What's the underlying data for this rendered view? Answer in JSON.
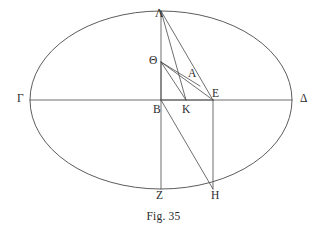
{
  "figure": {
    "caption": "Fig. 35",
    "caption_x": 163,
    "caption_y": 210
  },
  "style": {
    "stroke_color": "#4a4a4a",
    "stroke_width": 0.8,
    "ellipse_stroke_width": 0.9,
    "background": "#ffffff",
    "text_color": "#2b2b2b"
  },
  "ellipse": {
    "name": "outer-ellipse",
    "cx": 161,
    "cy": 100,
    "rx": 131,
    "ry": 89
  },
  "points": [
    {
      "id": "Lambda",
      "label": "Λ",
      "x": 161,
      "y": 11,
      "label_x": 155,
      "label_y": 8
    },
    {
      "id": "Theta",
      "label": "Θ",
      "x": 161,
      "y": 62,
      "label_x": 149,
      "label_y": 55
    },
    {
      "id": "A",
      "label": "A",
      "x": 193,
      "y": 80,
      "label_x": 188,
      "label_y": 68
    },
    {
      "id": "Gamma",
      "label": "Γ",
      "x": 30,
      "y": 100,
      "label_x": 17,
      "label_y": 93
    },
    {
      "id": "Delta",
      "label": "Δ",
      "x": 292,
      "y": 100,
      "label_x": 300,
      "label_y": 93
    },
    {
      "id": "E",
      "label": "E",
      "x": 213,
      "y": 100,
      "label_x": 212,
      "label_y": 88
    },
    {
      "id": "B",
      "label": "B",
      "x": 161,
      "y": 100,
      "label_x": 153,
      "label_y": 104
    },
    {
      "id": "K",
      "label": "K",
      "x": 186,
      "y": 100,
      "label_x": 182,
      "label_y": 104
    },
    {
      "id": "Z",
      "label": "Z",
      "x": 161,
      "y": 189,
      "label_x": 156,
      "label_y": 190
    },
    {
      "id": "H",
      "label": "H",
      "x": 213,
      "y": 189,
      "label_x": 211,
      "label_y": 190
    }
  ],
  "segments": [
    {
      "id": "gamma-delta-axis",
      "name": "horizontal-axis-gamma-delta",
      "x1": 30,
      "y1": 100,
      "x2": 292,
      "y2": 100
    },
    {
      "id": "lambda-z-axis",
      "name": "vertical-axis-lambda-z",
      "x1": 161,
      "y1": 11,
      "x2": 161,
      "y2": 189
    },
    {
      "id": "lambda-e",
      "name": "chord-lambda-e",
      "x1": 161,
      "y1": 11,
      "x2": 213,
      "y2": 100
    },
    {
      "id": "lambda-k",
      "name": "chord-lambda-k",
      "x1": 161,
      "y1": 11,
      "x2": 186,
      "y2": 100
    },
    {
      "id": "theta-e",
      "name": "chord-theta-e",
      "x1": 161,
      "y1": 62,
      "x2": 213,
      "y2": 100
    },
    {
      "id": "theta-k",
      "name": "chord-theta-k",
      "x1": 161,
      "y1": 62,
      "x2": 186,
      "y2": 100
    },
    {
      "id": "theta-b",
      "name": "chord-theta-b",
      "x1": 161,
      "y1": 62,
      "x2": 161,
      "y2": 100
    },
    {
      "id": "b-e",
      "name": "radius-b-e",
      "x1": 161,
      "y1": 100,
      "x2": 213,
      "y2": 100
    },
    {
      "id": "b-h",
      "name": "chord-b-h",
      "x1": 161,
      "y1": 100,
      "x2": 213,
      "y2": 189
    },
    {
      "id": "e-h",
      "name": "vertical-e-h",
      "x1": 213,
      "y1": 100,
      "x2": 213,
      "y2": 189
    },
    {
      "id": "theta-a-e",
      "name": "chord-theta-a",
      "x1": 161,
      "y1": 62,
      "x2": 200,
      "y2": 86
    }
  ]
}
